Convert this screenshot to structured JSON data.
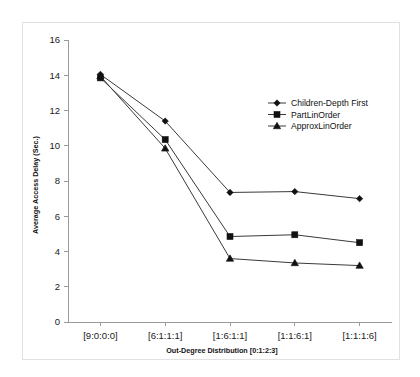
{
  "chart_data": {
    "type": "line",
    "title": "",
    "xlabel": "Out-Degree Distribution [0:1:2:3]",
    "ylabel": "Average Access Delay (Sec.)",
    "categories": [
      "[9:0:0:0]",
      "[6:1:1:1]",
      "[1:6:1:1]",
      "[1:1:6:1]",
      "[1:1:1:6]"
    ],
    "ylim": [
      0,
      16
    ],
    "yticks": [
      0,
      2,
      4,
      6,
      8,
      10,
      12,
      14,
      16
    ],
    "grid": false,
    "legend_position": "upper-right-inside",
    "series": [
      {
        "name": "Children-Depth First",
        "marker": "diamond",
        "values": [
          14.05,
          11.4,
          7.35,
          7.4,
          7.0
        ]
      },
      {
        "name": "PartLinOrder",
        "marker": "square",
        "values": [
          13.85,
          10.35,
          4.85,
          4.95,
          4.5
        ]
      },
      {
        "name": "ApproxLinOrder",
        "marker": "triangle",
        "values": [
          13.95,
          9.85,
          3.6,
          3.35,
          3.2
        ]
      }
    ]
  },
  "colors": {
    "line": "#3a3a3a",
    "marker": "#111111",
    "axis": "#9a9a9a",
    "text": "#111111",
    "background": "#ffffff",
    "frame": "#e2e2e2"
  }
}
